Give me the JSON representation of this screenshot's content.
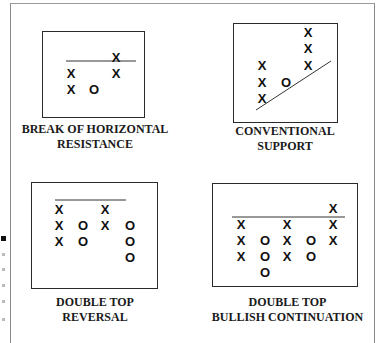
{
  "panels": [
    {
      "id": "break-of-horizontal-resistance",
      "label_line1": "BREAK OF HORIZONTAL",
      "label_line2": "RESISTANCE",
      "columns": [
        {
          "col": 1,
          "marks": [
            "X",
            "X"
          ]
        },
        {
          "col": 2,
          "marks": [
            "O"
          ]
        },
        {
          "col": 3,
          "marks": [
            "X",
            "X"
          ]
        }
      ],
      "reference_line": "horizontal resistance"
    },
    {
      "id": "conventional-support",
      "label_line1": "CONVENTIONAL",
      "label_line2": "SUPPORT",
      "columns": [
        {
          "col": 1,
          "marks": [
            "X",
            "X",
            "X"
          ]
        },
        {
          "col": 2,
          "marks": [
            "O"
          ]
        },
        {
          "col": 3,
          "marks": [
            "X",
            "X",
            "X"
          ]
        }
      ],
      "reference_line": "rising support trendline"
    },
    {
      "id": "double-top-reversal",
      "label_line1": "DOUBLE TOP",
      "label_line2": "REVERSAL",
      "columns": [
        {
          "col": 1,
          "marks": [
            "X",
            "X",
            "X"
          ]
        },
        {
          "col": 2,
          "marks": [
            "O",
            "O"
          ]
        },
        {
          "col": 3,
          "marks": [
            "X",
            "X"
          ]
        },
        {
          "col": 4,
          "marks": [
            "O",
            "O",
            "O"
          ]
        }
      ],
      "reference_line": "horizontal top"
    },
    {
      "id": "double-top-bullish-continuation",
      "label_line1": "DOUBLE TOP",
      "label_line2": "BULLISH CONTINUATION",
      "columns": [
        {
          "col": 1,
          "marks": [
            "X",
            "X",
            "X"
          ]
        },
        {
          "col": 2,
          "marks": [
            "O",
            "O",
            "O"
          ]
        },
        {
          "col": 3,
          "marks": [
            "X",
            "X",
            "X"
          ]
        },
        {
          "col": 4,
          "marks": [
            "O",
            "O"
          ]
        },
        {
          "col": 5,
          "marks": [
            "X",
            "X",
            "X"
          ]
        }
      ],
      "reference_line": "horizontal resistance"
    }
  ],
  "marks": {
    "x": "X",
    "o": "O"
  }
}
